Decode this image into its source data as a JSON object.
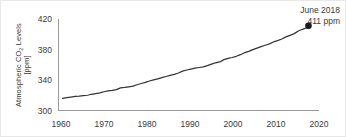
{
  "chart_data": {
    "type": "line",
    "title": "",
    "xlabel": "",
    "ylabel": "Atmospheric CO2 Levels [ppm]",
    "ylabel_line1": "Atmospheric CO",
    "ylabel_sub": "2",
    "ylabel_line1_tail": " Levels",
    "ylabel_line2": "[ppm]",
    "xlim": [
      1958,
      2021
    ],
    "ylim": [
      300,
      420
    ],
    "xticks": [
      1960,
      1970,
      1980,
      1990,
      2000,
      2010,
      2020
    ],
    "xtick_labels": [
      "1960",
      "1970",
      "1980",
      "1990",
      "2000",
      "2010",
      "2020"
    ],
    "yticks": [
      300,
      340,
      380,
      420
    ],
    "ytick_labels": [
      "300",
      "340",
      "380",
      "420"
    ],
    "grid": false,
    "legend": "none",
    "line_color": "#333333",
    "marker_color": "#1a1a1a",
    "axis_color": "#9a9a9a",
    "series": [
      {
        "name": "Mauna Loa CO2",
        "x": [
          1959,
          1960,
          1961,
          1962,
          1963,
          1964,
          1965,
          1966,
          1967,
          1968,
          1969,
          1970,
          1971,
          1972,
          1973,
          1974,
          1975,
          1976,
          1977,
          1978,
          1979,
          1980,
          1981,
          1982,
          1983,
          1984,
          1985,
          1986,
          1987,
          1988,
          1989,
          1990,
          1991,
          1992,
          1993,
          1994,
          1995,
          1996,
          1997,
          1998,
          1999,
          2000,
          2001,
          2002,
          2003,
          2004,
          2005,
          2006,
          2007,
          2008,
          2009,
          2010,
          2011,
          2012,
          2013,
          2014,
          2015,
          2016,
          2017,
          2018,
          2018.45
        ],
        "values": [
          315.9,
          316.9,
          317.6,
          318.4,
          318.9,
          319.6,
          320.0,
          321.3,
          322.1,
          323.0,
          324.6,
          325.6,
          326.3,
          327.4,
          329.6,
          330.2,
          331.1,
          332.0,
          333.8,
          335.4,
          336.8,
          338.7,
          340.1,
          341.4,
          343.0,
          344.6,
          346.0,
          347.4,
          349.2,
          351.6,
          353.1,
          354.4,
          355.6,
          356.4,
          357.1,
          358.8,
          360.8,
          362.6,
          363.7,
          366.7,
          368.4,
          369.5,
          371.1,
          373.2,
          375.8,
          377.5,
          379.8,
          381.9,
          383.8,
          385.6,
          387.4,
          389.9,
          391.6,
          393.8,
          396.5,
          398.6,
          400.8,
          404.2,
          406.5,
          408.5,
          411.0
        ]
      }
    ],
    "annotations": [
      {
        "name": "final-point",
        "line1": "June 2018",
        "line2": "411 ppm",
        "x": 2018.45,
        "y": 411
      }
    ]
  }
}
